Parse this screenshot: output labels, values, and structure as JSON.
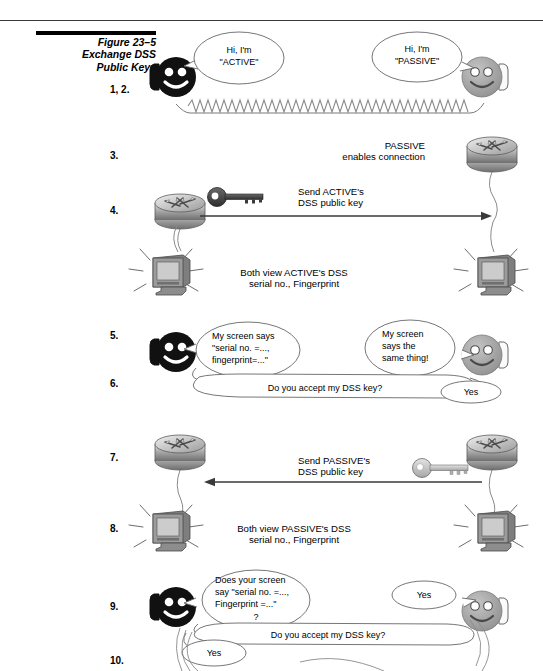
{
  "figure": {
    "number_label": "Figure 23–5",
    "title_line1": "Exchange DSS",
    "title_line2": "Public Keys"
  },
  "steps": [
    {
      "id": "1-2",
      "label": "1, 2."
    },
    {
      "id": "3",
      "label": "3."
    },
    {
      "id": "4",
      "label": "4."
    },
    {
      "id": "5",
      "label": "5."
    },
    {
      "id": "6",
      "label": "6."
    },
    {
      "id": "7",
      "label": "7."
    },
    {
      "id": "8",
      "label": "8."
    },
    {
      "id": "9",
      "label": "9."
    },
    {
      "id": "10",
      "label": "10."
    }
  ],
  "bubbles": {
    "active_hello": {
      "line1": "Hi, I'm",
      "line2": "\"ACTIVE\""
    },
    "passive_hello": {
      "line1": "Hi, I'm",
      "line2": "\"PASSIVE\""
    },
    "active_screen": {
      "line1": "My screen says",
      "line2": "\"serial no. =...,",
      "line3": "fingerprint=...\""
    },
    "passive_same": {
      "line1": "My screen",
      "line2": "says the",
      "line3": "same thing!"
    },
    "accept_q_6": {
      "line1": "Do you accept my DSS key?"
    },
    "yes_6": {
      "line1": "Yes"
    },
    "active_verify": {
      "line1": "Does your screen",
      "line2": "say \"serial no. =...,",
      "line3": "Fingerprint =...\"",
      "line4": "?"
    },
    "yes_9": {
      "line1": "Yes"
    },
    "accept_q_10": {
      "line1": "Do you accept my DSS key?"
    },
    "yes_10": {
      "line1": "Yes"
    }
  },
  "annotations": {
    "passive_enables": {
      "line1": "PASSIVE",
      "line2": "enables connection"
    },
    "send_active_key": {
      "line1": "Send ACTIVE's",
      "line2": "DSS public key"
    },
    "both_view_active": {
      "line1": "Both view ACTIVE's DSS",
      "line2": "serial no., Fingerprint"
    },
    "send_passive_key": {
      "line1": "Send PASSIVE's",
      "line2": "DSS public key"
    },
    "both_view_passive": {
      "line1": "Both view PASSIVE's DSS",
      "line2": "serial no., Fingerprint"
    }
  },
  "icons": {
    "active_face": "smiley-face-black-icon",
    "passive_face": "smiley-face-gray-icon",
    "router": "router-icon",
    "monitor": "monitor-icon",
    "key_dark": "key-dark-icon",
    "key_light": "key-light-icon",
    "phone_cord": "phone-cord-icon",
    "arrow_right": "arrow-right-icon",
    "arrow_left": "arrow-left-icon"
  },
  "colors": {
    "page_background": "#ffffff",
    "ink": "#000000",
    "rule": "#3a3a3a",
    "active_face_fill": "#111111",
    "passive_face_fill": "#a8a8a8",
    "router_body": "#b5b5b5",
    "router_top": "#d8d8d8",
    "monitor_body": "#8f8f8f",
    "monitor_screen": "#c9c9c9",
    "key_dark_fill": "#4a4a4a",
    "key_light_fill": "#c0c0c0",
    "bubble_stroke": "#555555",
    "bubble_fill": "#ffffff"
  }
}
